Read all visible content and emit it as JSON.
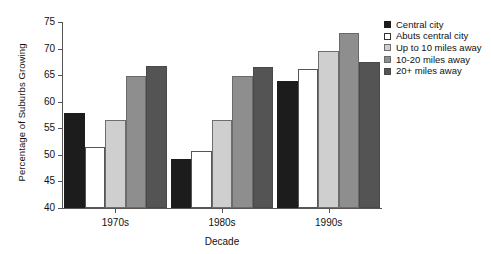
{
  "chart_data": {
    "type": "bar",
    "title": "",
    "subtitle": "",
    "xlabel": "Decade",
    "ylabel": "Percentage of Suburbs Growing",
    "categories": [
      "1970s",
      "1980s",
      "1990s"
    ],
    "ylim": [
      40,
      75
    ],
    "yticks": [
      40,
      45,
      50,
      55,
      60,
      65,
      70,
      75
    ],
    "ytick_labels": [
      "40",
      "45",
      "50",
      "55",
      "60",
      "65",
      "70",
      "75"
    ],
    "grid": false,
    "legend_position": "top-right",
    "series": [
      {
        "name": "Central city",
        "color": "#1c1c1c",
        "edge_color": "#1c1c1c",
        "values": [
          57.8,
          49.2,
          63.9
        ]
      },
      {
        "name": "Abuts central city",
        "color": "#ffffff",
        "edge_color": "#555555",
        "values": [
          51.5,
          50.7,
          66.1
        ]
      },
      {
        "name": "Up to 10 miles away",
        "color": "#cfcfcf",
        "edge_color": "#6e6e6e",
        "values": [
          56.6,
          56.6,
          69.6
        ]
      },
      {
        "name": "10-20 miles away",
        "color": "#8e8e8e",
        "edge_color": "#6a6a6a",
        "values": [
          64.9,
          64.9,
          73.0
        ]
      },
      {
        "name": "20+ miles away",
        "color": "#545454",
        "edge_color": "#494949",
        "values": [
          66.7,
          66.5,
          67.4
        ]
      }
    ]
  },
  "legend": {
    "items": [
      {
        "label": "Central city"
      },
      {
        "label": "Abuts central city"
      },
      {
        "label": "Up to 10 miles away"
      },
      {
        "label": "10-20 miles away"
      },
      {
        "label": "20+ miles away"
      }
    ]
  },
  "axes": {
    "y_title": "Percentage of Suburbs Growing",
    "x_title": "Decade"
  }
}
